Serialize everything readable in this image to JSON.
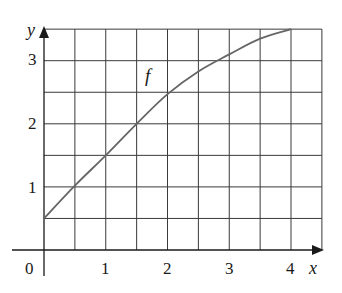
{
  "chart_data": {
    "type": "line",
    "title": "",
    "xlabel": "x",
    "ylabel": "y",
    "xlim": [
      0,
      4.5
    ],
    "ylim": [
      0,
      3.5
    ],
    "grid": true,
    "grid_step": 0.5,
    "x_ticks": [
      "0",
      "1",
      "2",
      "3",
      "4"
    ],
    "y_ticks": [
      "1",
      "2",
      "3"
    ],
    "origin_label": "0",
    "series": [
      {
        "name": "f",
        "x": [
          0,
          0.5,
          1.0,
          1.5,
          2.0,
          2.5,
          3.0,
          3.5,
          4.0
        ],
        "y": [
          0.5,
          1.02,
          1.5,
          2.0,
          2.47,
          2.83,
          3.1,
          3.35,
          3.5
        ]
      }
    ],
    "annotations": [
      {
        "text": "f",
        "x": 1.7,
        "y": 2.75
      }
    ]
  }
}
